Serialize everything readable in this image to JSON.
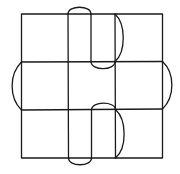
{
  "figure": {
    "grid": {
      "rows": 3,
      "cols": 3
    },
    "stroke_color": "#1a1a1a",
    "background": "#ffffff"
  }
}
